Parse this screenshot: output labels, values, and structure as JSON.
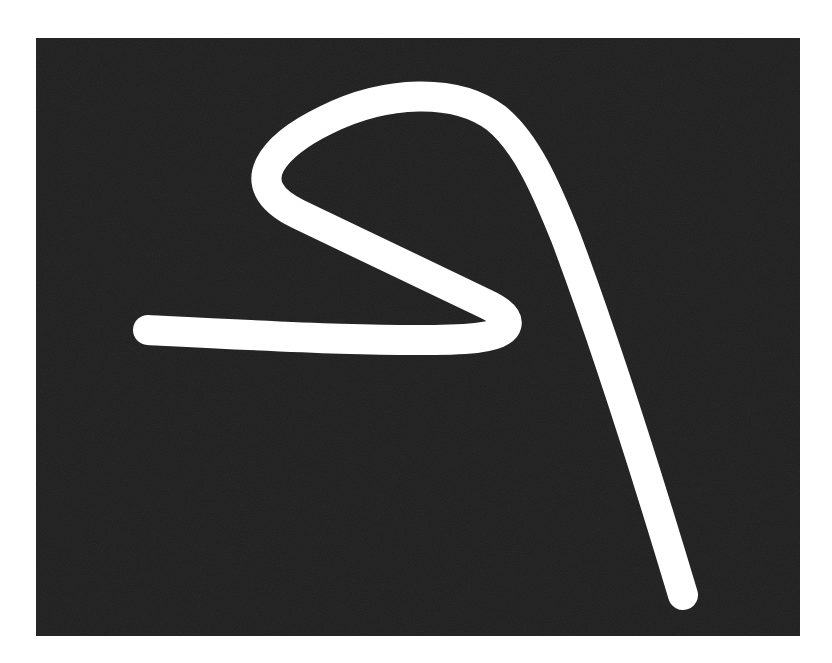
{
  "image": {
    "description": "White hand-drawn stroke on dark noisy background",
    "background_color": "#ffffff",
    "panel_color": "#1e1e1e",
    "stroke_color": "#ffffff",
    "stroke_width": 30
  },
  "stroke": {
    "path": "M 112 292 C 230 298, 380 306, 440 300 C 478 296, 480 280, 450 266 L 262 176 C 200 146, 240 106, 290 82 C 350 52, 420 50, 460 80 C 490 104, 510 150, 530 200 C 560 280, 600 400, 647 557"
  }
}
